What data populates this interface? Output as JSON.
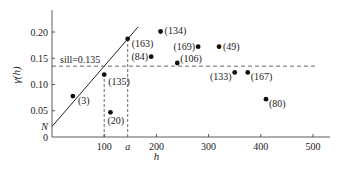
{
  "chart_data": {
    "type": "scatter",
    "title": "",
    "xlabel": "h",
    "ylabel": "γ(h)",
    "xlim": [
      0,
      520
    ],
    "ylim": [
      0,
      0.24
    ],
    "grid": false,
    "x_ticks": [
      100,
      200,
      300,
      400,
      500
    ],
    "x_tick_labels": [
      "100",
      "200",
      "300",
      "400",
      "500"
    ],
    "extra_x_tick": {
      "label": "a",
      "x": 145
    },
    "y_ticks": [
      0,
      0.05,
      0.1,
      0.15,
      0.2
    ],
    "y_tick_labels": [
      "0",
      "0.05",
      "0.10",
      "0.15",
      "0.20"
    ],
    "extra_y_label": {
      "label": "N",
      "y": 0.02
    },
    "points": [
      {
        "x": 40,
        "y": 0.078,
        "label": "(3)"
      },
      {
        "x": 100,
        "y": 0.119,
        "label": "(135)"
      },
      {
        "x": 145,
        "y": 0.187,
        "label": "(163)"
      },
      {
        "x": 112,
        "y": 0.047,
        "label": "(20)"
      },
      {
        "x": 190,
        "y": 0.153,
        "label": "(84)"
      },
      {
        "x": 208,
        "y": 0.201,
        "label": "(134)"
      },
      {
        "x": 240,
        "y": 0.141,
        "label": "(106)"
      },
      {
        "x": 280,
        "y": 0.172,
        "label": "(169)"
      },
      {
        "x": 320,
        "y": 0.172,
        "label": "(49)"
      },
      {
        "x": 350,
        "y": 0.123,
        "label": "(133)"
      },
      {
        "x": 375,
        "y": 0.123,
        "label": "(167)"
      },
      {
        "x": 410,
        "y": 0.072,
        "label": "(80)"
      }
    ],
    "model_line": {
      "type": "linear",
      "nugget": 0.02,
      "slope": 0.00115,
      "x_end": 165
    },
    "sill": {
      "value": 0.135,
      "label": "sill=0.135",
      "style": "dashed"
    },
    "reference_lines": [
      {
        "x": 100,
        "style": "dashed",
        "from_y": 0,
        "to_y": 0.119
      },
      {
        "x": 145,
        "style": "dashed",
        "from_y": 0,
        "to_y": 0.187
      }
    ]
  }
}
